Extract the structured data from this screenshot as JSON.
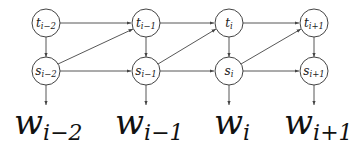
{
  "diagram": {
    "type": "graphical-model",
    "columns": [
      {
        "t": {
          "base": "t",
          "sub": "i−2"
        },
        "s": {
          "base": "s",
          "sub": "i−2"
        },
        "w": {
          "base": "w",
          "sub": "i−2"
        }
      },
      {
        "t": {
          "base": "t",
          "sub": "i−1"
        },
        "s": {
          "base": "s",
          "sub": "i−1"
        },
        "w": {
          "base": "w",
          "sub": "i−1"
        }
      },
      {
        "t": {
          "base": "t",
          "sub": "i"
        },
        "s": {
          "base": "s",
          "sub": "i"
        },
        "w": {
          "base": "w",
          "sub": "i"
        }
      },
      {
        "t": {
          "base": "t",
          "sub": "i+1"
        },
        "s": {
          "base": "s",
          "sub": "i+1"
        },
        "w": {
          "base": "w",
          "sub": "i+1"
        }
      }
    ],
    "edges": [
      "t_{i-2} -> t_{i-1}",
      "t_{i-1} -> t_i",
      "t_i -> t_{i+1}",
      "s_{i-2} -> s_{i-1}",
      "s_{i-1} -> s_i",
      "s_i -> s_{i+1}",
      "t_k -> s_k (each column)",
      "s_{i-2} -> t_{i-1}",
      "s_{i-1} -> t_i",
      "s_i -> t_{i+1}",
      "s_k -> w_k (each column)"
    ],
    "colors": {
      "stroke": "#444444",
      "text": "#111111",
      "background": "#ffffff"
    }
  }
}
